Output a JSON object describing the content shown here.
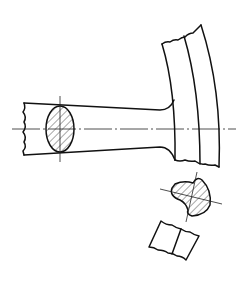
{
  "figure": {
    "type": "technical-drawing",
    "colors": {
      "line": "#111111",
      "background": "#ffffff"
    },
    "parts": [
      {
        "id": "spoke",
        "description": "tapered spoke with broken-off left end"
      },
      {
        "id": "spoke-section",
        "description": "hatched elliptical revolved section on spoke"
      },
      {
        "id": "rim",
        "description": "curved rim segment with two arcs and break lines"
      },
      {
        "id": "removed-section-1",
        "description": "hatched pear-shaped removed section of spoke-rim junction"
      },
      {
        "id": "removed-section-2",
        "description": "unhatched rim cross-section piece with break lines"
      }
    ]
  }
}
